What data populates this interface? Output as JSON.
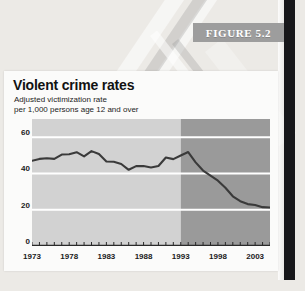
{
  "figure": {
    "banner_label": "FIGURE 5.2"
  },
  "card": {
    "title": "Violent crime rates",
    "subtitle": "Adjusted victimization rate\nper 1,000 persons age 12 and over"
  },
  "colors": {
    "banner_bg": "#9d9d9d",
    "card_bg": "#fbfbfa",
    "plot_light": "#d2d2d2",
    "plot_dark": "#9a9a9a",
    "gridline": "#ffffff",
    "line": "#3a3a3a",
    "spine": "#17171a",
    "page_bg": "#eceae6"
  },
  "chart_data": {
    "type": "line",
    "title": "Violent crime rates",
    "subtitle": "Adjusted victimization rate per 1,000 persons age 12 and over",
    "xlabel": "",
    "ylabel": "",
    "xlim": [
      1973,
      2005
    ],
    "ylim": [
      0,
      70
    ],
    "yticks": [
      0,
      20,
      40,
      60
    ],
    "xticks": [
      1973,
      1978,
      1983,
      1988,
      1993,
      1998,
      2003
    ],
    "xtick_minor_every": 1,
    "grid": true,
    "gridline_color": "#ffffff",
    "legend": null,
    "shaded_regions": [
      {
        "name": "light-period",
        "from": 1973,
        "to": 1993,
        "color": "#d2d2d2"
      },
      {
        "name": "dark-period",
        "from": 1993,
        "to": 2005,
        "color": "#9a9a9a"
      }
    ],
    "x": [
      1973,
      1974,
      1975,
      1976,
      1977,
      1978,
      1979,
      1980,
      1981,
      1982,
      1983,
      1984,
      1985,
      1986,
      1987,
      1988,
      1989,
      1990,
      1991,
      1992,
      1993,
      1994,
      1995,
      1996,
      1997,
      1998,
      1999,
      2000,
      2001,
      2002,
      2003,
      2004,
      2005
    ],
    "values": [
      47.0,
      48.0,
      48.4,
      48.0,
      50.4,
      50.6,
      51.7,
      49.4,
      52.3,
      50.7,
      46.6,
      46.4,
      45.2,
      42.0,
      44.0,
      44.1,
      43.3,
      44.1,
      48.8,
      47.9,
      49.9,
      51.8,
      46.1,
      41.6,
      38.8,
      36.0,
      32.1,
      27.4,
      24.7,
      23.1,
      22.6,
      21.4,
      21.2
    ],
    "annotations": [
      {
        "text": "peak",
        "x": 1994,
        "y": 51.8
      }
    ]
  }
}
